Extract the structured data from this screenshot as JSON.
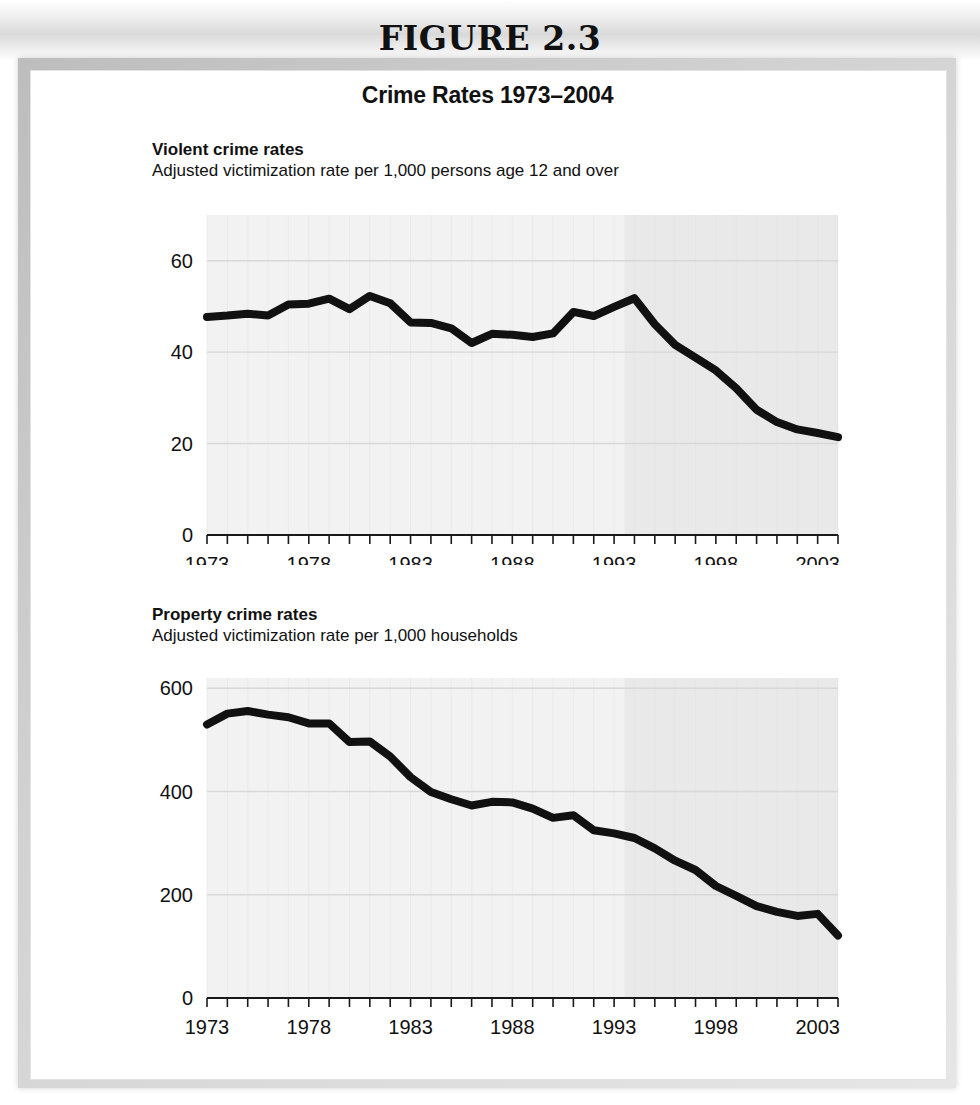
{
  "figure": {
    "number_label": "FIGURE 2.3",
    "heading": "Crime Rates 1973–2004"
  },
  "panels": [
    {
      "id": "violent",
      "title": "Violent crime rates",
      "subtitle": "Adjusted victimization rate per 1,000 persons age 12 and over"
    },
    {
      "id": "property",
      "title": "Property crime rates",
      "subtitle": "Adjusted victimization rate per 1,000 households"
    }
  ],
  "colors": {
    "line": "#111111",
    "plot_background_left": "#f2f2f2",
    "plot_background_right": "#e9e9e9",
    "gridline": "#d8d8d8",
    "axis": "#1a1a1a",
    "text": "#111111"
  },
  "chart_data": [
    {
      "type": "line",
      "title": "Violent crime rates",
      "subtitle": "Adjusted victimization rate per 1,000 persons age 12 and over",
      "xlabel": "",
      "ylabel": "",
      "grid": true,
      "legend": "none",
      "xlim": [
        1973,
        2004
      ],
      "ylim": [
        0,
        70
      ],
      "yticks": [
        0,
        20,
        40,
        60
      ],
      "ytick_labels": [
        "0",
        "20",
        "40",
        "60"
      ],
      "xticks": [
        1973,
        1974,
        1975,
        1976,
        1977,
        1978,
        1979,
        1980,
        1981,
        1982,
        1983,
        1984,
        1985,
        1986,
        1987,
        1988,
        1989,
        1990,
        1991,
        1992,
        1993,
        1994,
        1995,
        1996,
        1997,
        1998,
        1999,
        2000,
        2001,
        2002,
        2003,
        2004
      ],
      "xtick_labels": [
        "1973",
        "1978",
        "1983",
        "1988",
        "1993",
        "1998",
        "2003"
      ],
      "xtick_label_years": [
        1973,
        1978,
        1983,
        1988,
        1993,
        1998,
        2003
      ],
      "x": [
        1973,
        1974,
        1975,
        1976,
        1977,
        1978,
        1979,
        1980,
        1981,
        1982,
        1983,
        1984,
        1985,
        1986,
        1987,
        1988,
        1989,
        1990,
        1991,
        1992,
        1993,
        1994,
        1995,
        1996,
        1997,
        1998,
        1999,
        2000,
        2001,
        2002,
        2003,
        2004
      ],
      "y": [
        47.7,
        48.0,
        48.4,
        48.0,
        50.4,
        50.6,
        51.7,
        49.4,
        52.3,
        50.7,
        46.5,
        46.4,
        45.2,
        42.0,
        44.0,
        43.8,
        43.3,
        44.1,
        48.8,
        47.9,
        49.9,
        51.8,
        46.1,
        41.6,
        38.8,
        36.0,
        32.1,
        27.4,
        24.7,
        23.1,
        22.3,
        21.4
      ],
      "series": [
        {
          "name": "Violent crime rate",
          "values": [
            47.7,
            48.0,
            48.4,
            48.0,
            50.4,
            50.6,
            51.7,
            49.4,
            52.3,
            50.7,
            46.5,
            46.4,
            45.2,
            42.0,
            44.0,
            43.8,
            43.3,
            44.1,
            48.8,
            47.9,
            49.9,
            51.8,
            46.1,
            41.6,
            38.8,
            36.0,
            32.1,
            27.4,
            24.7,
            23.1,
            22.3,
            21.4
          ]
        }
      ]
    },
    {
      "type": "line",
      "title": "Property crime rates",
      "subtitle": "Adjusted victimization rate per 1,000 households",
      "xlabel": "",
      "ylabel": "",
      "grid": true,
      "legend": "none",
      "xlim": [
        1973,
        2004
      ],
      "ylim": [
        0,
        620
      ],
      "yticks": [
        0,
        200,
        400,
        600
      ],
      "ytick_labels": [
        "0",
        "200",
        "400",
        "600"
      ],
      "xticks": [
        1973,
        1974,
        1975,
        1976,
        1977,
        1978,
        1979,
        1980,
        1981,
        1982,
        1983,
        1984,
        1985,
        1986,
        1987,
        1988,
        1989,
        1990,
        1991,
        1992,
        1993,
        1994,
        1995,
        1996,
        1997,
        1998,
        1999,
        2000,
        2001,
        2002,
        2003,
        2004
      ],
      "xtick_labels": [
        "1973",
        "1978",
        "1983",
        "1988",
        "1993",
        "1998",
        "2003"
      ],
      "xtick_label_years": [
        1973,
        1978,
        1983,
        1988,
        1993,
        1998,
        2003
      ],
      "x": [
        1973,
        1974,
        1975,
        1976,
        1977,
        1978,
        1979,
        1980,
        1981,
        1982,
        1983,
        1984,
        1985,
        1986,
        1987,
        1988,
        1989,
        1990,
        1991,
        1992,
        1993,
        1994,
        1995,
        1996,
        1997,
        1998,
        1999,
        2000,
        2001,
        2002,
        2003,
        2004
      ],
      "y": [
        530,
        551,
        556,
        549,
        544,
        532,
        532,
        496,
        497,
        468,
        428,
        399,
        385,
        373,
        380,
        379,
        367,
        349,
        354,
        325,
        319,
        310,
        290,
        266,
        248,
        217,
        198,
        178,
        167,
        159,
        163,
        121
      ],
      "series": [
        {
          "name": "Property crime rate",
          "values": [
            530,
            551,
            556,
            549,
            544,
            532,
            532,
            496,
            497,
            468,
            428,
            399,
            385,
            373,
            380,
            379,
            367,
            349,
            354,
            325,
            319,
            310,
            290,
            266,
            248,
            217,
            198,
            178,
            167,
            159,
            163,
            121
          ]
        }
      ]
    }
  ]
}
